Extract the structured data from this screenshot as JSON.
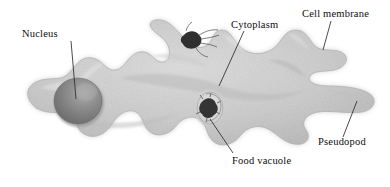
{
  "figure": {
    "background_color": "#ffffff"
  },
  "labels": [
    {
      "id": "nucleus",
      "text": "Nucleus",
      "leader": {
        "x1": 71,
        "y1": 41,
        "x2": 76,
        "y2": 99
      }
    },
    {
      "id": "cytoplasm",
      "text": "Cytoplasm",
      "leader": {
        "x1": 244,
        "y1": 31,
        "x2": 219,
        "y2": 86
      }
    },
    {
      "id": "cell_membrane",
      "text": "Cell membrane",
      "leader": {
        "x1": 331,
        "y1": 21,
        "x2": 323,
        "y2": 50
      }
    },
    {
      "id": "food_vacuole",
      "text": "Food vacuole",
      "leader": {
        "x1": 210,
        "y1": 119,
        "x2": 233,
        "y2": 153
      }
    },
    {
      "id": "pseudopod",
      "text": "Pseudopod",
      "leader": {
        "x1": 357,
        "y1": 101,
        "x2": 343,
        "y2": 137
      }
    }
  ],
  "structures": {
    "cell_body": {
      "name": "cytoplasm-body",
      "fill": "#c8c8c8",
      "edge": "#b0b0b0"
    },
    "nucleus": {
      "name": "nucleus",
      "fill": "#8d8d8d",
      "highlight": "#a8a8a8",
      "rim": "#6f6f6f",
      "cx": 78,
      "cy": 101,
      "rx": 24,
      "ry": 23
    },
    "food_vacuole": {
      "name": "food-vacuole",
      "fill": "#3b3b3b",
      "halo": "#dedede",
      "cx": 210,
      "cy": 108,
      "rx": 14,
      "ry": 17
    },
    "ingested_particle": {
      "name": "ingested-particle",
      "fill": "#313131",
      "cx": 191,
      "cy": 39,
      "rx": 9,
      "ry": 8
    }
  },
  "colors": {
    "background": "#ffffff",
    "text": "#0d0d0d",
    "leader_line": "#2b2b2b",
    "cell_light": "#d6d6d6",
    "cell_mid": "#c6c6c6",
    "cell_shadow": "#ababab",
    "nucleus_dark": "#7f7f7f"
  }
}
